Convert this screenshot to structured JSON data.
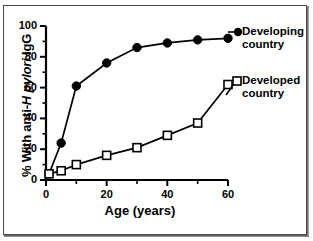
{
  "chart_data": {
    "type": "line",
    "title": "",
    "subtitle": "",
    "xlabel": "Age (years)",
    "ylabel": "% With anti-H pylori IgG",
    "ylabel_parts": {
      "pre": "% With anti-",
      "italic": "H pylori",
      "post": " IgG"
    },
    "xlim": [
      0,
      60
    ],
    "ylim": [
      0,
      100
    ],
    "x_ticks": [
      0,
      20,
      40,
      60
    ],
    "x_tick_labels": [
      "0",
      "20",
      "40",
      "60"
    ],
    "x_minor_ticks": [
      10,
      30,
      50
    ],
    "y_ticks": [
      0,
      20,
      40,
      60,
      80,
      100
    ],
    "y_tick_labels": [
      "0",
      "20",
      "40",
      "60",
      "80",
      "100"
    ],
    "y_minor_ticks": [
      10,
      30,
      50,
      70,
      90
    ],
    "grid": false,
    "legend_position": "right-inside",
    "series": [
      {
        "name": "Developing country",
        "marker": "filled-circle",
        "color": "#000000",
        "x": [
          1,
          5,
          10,
          20,
          30,
          40,
          50,
          60
        ],
        "values": [
          4,
          24,
          61,
          76,
          86,
          89,
          91,
          92
        ]
      },
      {
        "name": "Developed country",
        "marker": "open-square",
        "color": "#000000",
        "x": [
          1,
          5,
          10,
          20,
          30,
          40,
          50,
          60
        ],
        "values": [
          4,
          6,
          10,
          16,
          21,
          29,
          37,
          62
        ]
      }
    ]
  },
  "legend": {
    "items": [
      {
        "label_line1": "Developing",
        "label_line2": "country",
        "marker": "filled-circle"
      },
      {
        "label_line1": "Developed",
        "label_line2": "country",
        "marker": "open-square"
      }
    ]
  }
}
